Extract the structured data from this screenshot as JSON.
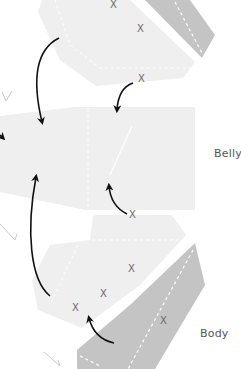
{
  "diagram": {
    "type": "pattern-assembly",
    "labels": {
      "belly": "Belly",
      "body": "Body"
    },
    "marker_glyph": "X",
    "colors": {
      "background": "#ffffff",
      "light_piece": "#efefef",
      "dark_piece": "#c4c4c4",
      "seam_line": "#ffffff",
      "arrow": "#111111",
      "marker": "#6a6a6a",
      "label_text": "#555555",
      "stitch_mark": "#bdbdbd"
    },
    "pieces": [
      {
        "name": "top-light-panel",
        "tone": "light"
      },
      {
        "name": "top-dark-strip",
        "tone": "dark"
      },
      {
        "name": "belly-panel",
        "tone": "light"
      },
      {
        "name": "bottom-light-panel",
        "tone": "light"
      },
      {
        "name": "body-dark-strip",
        "tone": "dark"
      }
    ],
    "markers": [
      {
        "x": 114,
        "y": 4
      },
      {
        "x": 141,
        "y": 28
      },
      {
        "x": 142,
        "y": 78
      },
      {
        "x": 133,
        "y": 334
      },
      {
        "x": 160,
        "y": 268
      },
      {
        "x": 105,
        "y": 293
      },
      {
        "x": 76,
        "y": 307
      },
      {
        "x": 164,
        "y": 320
      }
    ],
    "arrows_count": 6
  }
}
